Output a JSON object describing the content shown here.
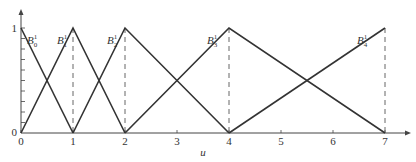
{
  "chart_data": {
    "type": "line",
    "title": "",
    "xlabel": "u",
    "ylabel": "",
    "xlim": [
      0,
      7
    ],
    "ylim": [
      0,
      1
    ],
    "x_ticks": [
      "0",
      "1",
      "2",
      "3",
      "4",
      "5",
      "6",
      "7"
    ],
    "y_ticks": [
      "0",
      "1"
    ],
    "y_minor_divisions": 10,
    "knots": [
      0,
      0,
      1,
      2,
      4,
      7,
      7
    ],
    "grid": false,
    "legend": "inline labels",
    "series": [
      {
        "name": "B_0^1",
        "label_main": "B",
        "label_sub": "0",
        "label_sup": "1",
        "x": [
          0,
          1
        ],
        "y": [
          1,
          0
        ]
      },
      {
        "name": "B_1^1",
        "label_main": "B",
        "label_sub": "1",
        "label_sup": "1",
        "x": [
          0,
          1,
          2
        ],
        "y": [
          0,
          1,
          0
        ]
      },
      {
        "name": "B_2^1",
        "label_main": "B",
        "label_sub": "2",
        "label_sup": "1",
        "x": [
          1,
          2,
          4
        ],
        "y": [
          0,
          1,
          0
        ]
      },
      {
        "name": "B_3^1",
        "label_main": "B",
        "label_sub": "3",
        "label_sup": "1",
        "x": [
          2,
          4,
          7
        ],
        "y": [
          0,
          1,
          0
        ]
      },
      {
        "name": "B_4^1",
        "label_main": "B",
        "label_sub": "4",
        "label_sup": "1",
        "x": [
          4,
          7
        ],
        "y": [
          0,
          1
        ]
      }
    ],
    "dashed_verticals_at": [
      1,
      2,
      4,
      7
    ],
    "colors": {
      "line": "#333333",
      "axis": "#444444",
      "dash": "#555555"
    }
  }
}
